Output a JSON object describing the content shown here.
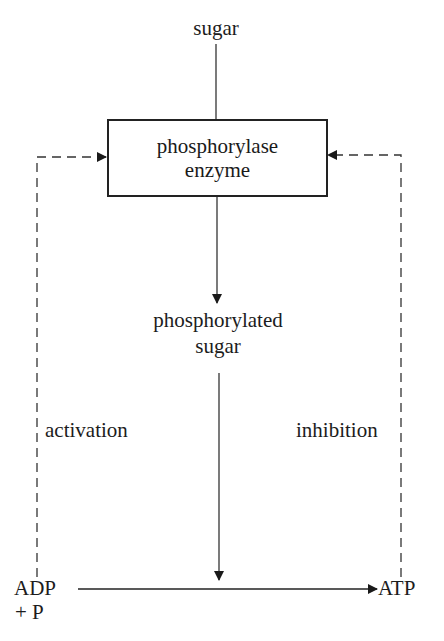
{
  "diagram": {
    "type": "feedback-regulation-flow",
    "nodes": {
      "sugar": "sugar",
      "enzyme_line1": "phosphorylase",
      "enzyme_line2": "enzyme",
      "product_line1": "phosphorylated",
      "product_line2": "sugar",
      "adp_line1": "ADP",
      "adp_line2": "+ P",
      "atp": "ATP"
    },
    "edge_labels": {
      "left_feedback": "activation",
      "right_feedback": "inhibition"
    },
    "edges": [
      {
        "from": "sugar",
        "to": "phosphorylase enzyme",
        "style": "solid"
      },
      {
        "from": "phosphorylase enzyme",
        "to": "phosphorylated sugar",
        "style": "solid-arrow"
      },
      {
        "from": "phosphorylated sugar",
        "to": "ADP→ATP reaction",
        "style": "solid-arrow"
      },
      {
        "from": "ADP + P",
        "to": "ATP",
        "style": "solid-arrow"
      },
      {
        "from": "ADP + P",
        "to": "phosphorylase enzyme",
        "style": "dashed-arrow",
        "label": "activation"
      },
      {
        "from": "ATP",
        "to": "phosphorylase enzyme",
        "style": "dashed-arrow",
        "label": "inhibition"
      }
    ],
    "colors": {
      "line": "#222222",
      "background": "#ffffff"
    }
  }
}
